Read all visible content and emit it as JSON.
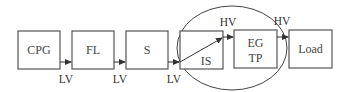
{
  "diagram": {
    "blocks": [
      {
        "id": "cpg",
        "label": "CPG"
      },
      {
        "id": "fl",
        "label": "FL"
      },
      {
        "id": "s",
        "label": "S"
      },
      {
        "id": "is",
        "label": "IS"
      },
      {
        "id": "egtp",
        "label_line1": "EG",
        "label_line2": "TP"
      },
      {
        "id": "load",
        "label": "Load"
      }
    ],
    "voltage_labels": {
      "cpg_fl": "LV",
      "fl_s": "LV",
      "s_is": "LV",
      "is_egtp": "HV",
      "egtp_load": "HV"
    },
    "grouping": "ellipse-around-IS-and-EGTP",
    "colors": {
      "stroke": "#555555",
      "text": "#444444",
      "background": "#ffffff"
    }
  }
}
